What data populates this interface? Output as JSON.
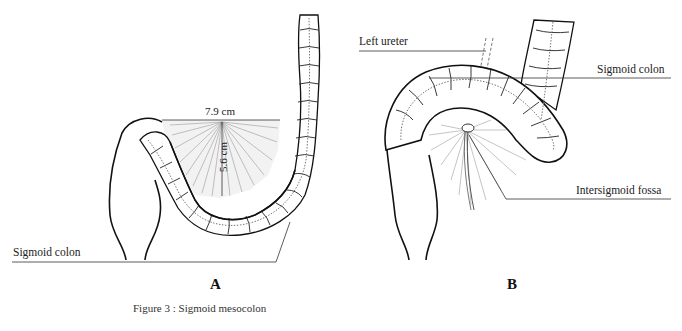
{
  "figure": {
    "caption": "Figure 3 : Sigmoid mesocolon",
    "panels": [
      {
        "id": "A",
        "letter": "A",
        "labels": {
          "structure": "Sigmoid colon",
          "width_measure": "7.9 cm",
          "height_measure": "5.6 cm"
        }
      },
      {
        "id": "B",
        "letter": "B",
        "labels": {
          "ureter": "Left ureter",
          "structure": "Sigmoid colon",
          "fossa": "Intersigmoid fossa"
        }
      }
    ]
  },
  "colors": {
    "ink": "#1a1a1a",
    "leader_line": "#333333",
    "hatch": "#777777",
    "background": "#ffffff"
  }
}
